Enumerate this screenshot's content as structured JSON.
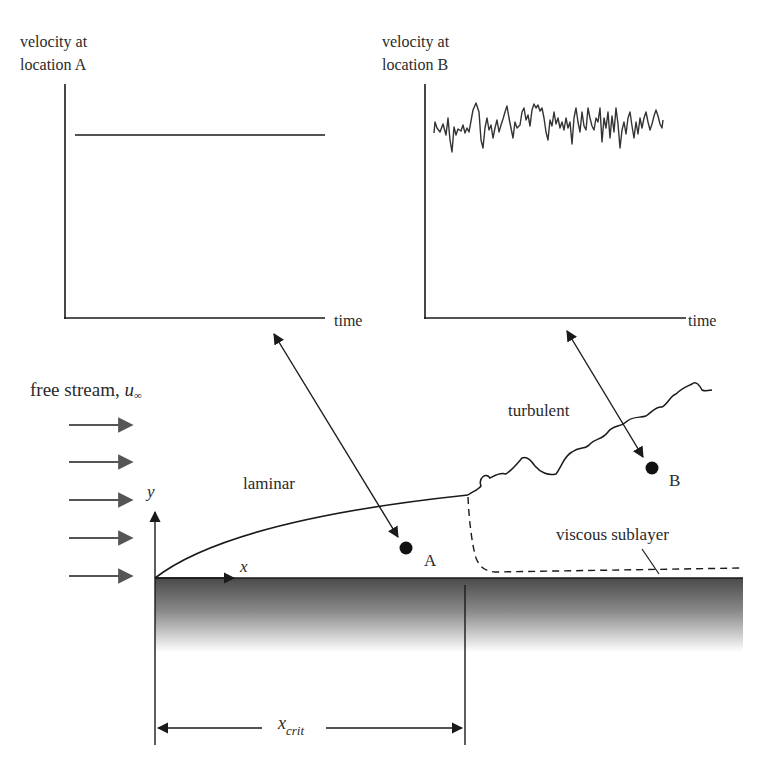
{
  "graph_a": {
    "ylabel_line1": "velocity at",
    "ylabel_line2": "location A",
    "xlabel": "time",
    "signal": "constant"
  },
  "graph_b": {
    "ylabel_line1": "velocity at",
    "ylabel_line2": "location B",
    "xlabel": "time",
    "signal": "fluctuating"
  },
  "flow": {
    "free_stream_label": "free stream, ",
    "free_stream_symbol": "u",
    "free_stream_subscript": "∞",
    "arrow_count": 5
  },
  "regions": {
    "laminar": "laminar",
    "turbulent": "turbulent",
    "viscous_sublayer": "viscous sublayer"
  },
  "points": {
    "a": "A",
    "b": "B"
  },
  "axes": {
    "x": "x",
    "y": "y"
  },
  "dimension": {
    "symbol": "x",
    "subscript": "crit"
  },
  "colors": {
    "line": "#1a1a1a",
    "free_stream_arrow": "#555555",
    "plate_top": "#4a4a4a",
    "plate_bottom": "#ffffff"
  }
}
